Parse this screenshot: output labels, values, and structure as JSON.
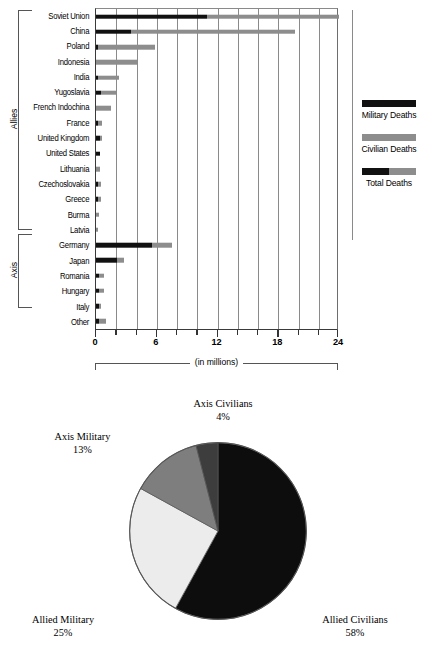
{
  "chart_data": [
    {
      "type": "bar",
      "orientation": "horizontal",
      "stacked": true,
      "title": "",
      "xlabel": "(in millions)",
      "ylabel": "",
      "xlim": [
        0,
        24
      ],
      "xticks": [
        0,
        6,
        12,
        18,
        24
      ],
      "xtick_labels": [
        "0",
        "6",
        "12",
        "18",
        "24"
      ],
      "minor_tick_step": 2,
      "grid": true,
      "legend_position": "right",
      "series": [
        {
          "name": "Military Deaths",
          "color": "#111111"
        },
        {
          "name": "Civilian Deaths",
          "color": "#8d8d8d"
        },
        {
          "name": "Total Deaths",
          "color": "#111111/#8d8d8d"
        }
      ],
      "groups": [
        {
          "name": "Allies",
          "categories": [
            "Soviet Union",
            "China",
            "Poland",
            "Indonesia",
            "India",
            "Yugoslavia",
            "French Indochina",
            "France",
            "United Kingdom",
            "United States",
            "Lithuania",
            "Czechoslovakia",
            "Greece",
            "Burma",
            "Latvia"
          ]
        },
        {
          "name": "Axis",
          "categories": [
            "Germany",
            "Japan",
            "Romania",
            "Hungary",
            "Italy"
          ]
        }
      ],
      "categories": [
        "Soviet Union",
        "China",
        "Poland",
        "Indonesia",
        "India",
        "Yugoslavia",
        "French Indochina",
        "France",
        "United Kingdom",
        "United States",
        "Lithuania",
        "Czechoslovakia",
        "Greece",
        "Burma",
        "Latvia",
        "Germany",
        "Japan",
        "Romania",
        "Hungary",
        "Italy",
        "Other"
      ],
      "bars": [
        {
          "category": "Soviet Union",
          "military": 11.0,
          "civilian": 13.0,
          "total": 24.0
        },
        {
          "category": "China",
          "military": 3.5,
          "civilian": 16.2,
          "total": 19.7
        },
        {
          "category": "Poland",
          "military": 0.24,
          "civilian": 5.6,
          "total": 5.8
        },
        {
          "category": "Indonesia",
          "military": 0.0,
          "civilian": 4.0,
          "total": 4.0
        },
        {
          "category": "India",
          "military": 0.09,
          "civilian": 2.1,
          "total": 2.2
        },
        {
          "category": "Yugoslavia",
          "military": 0.45,
          "civilian": 1.55,
          "total": 2.0
        },
        {
          "category": "French Indochina",
          "military": 0.0,
          "civilian": 1.5,
          "total": 1.5
        },
        {
          "category": "France",
          "military": 0.21,
          "civilian": 0.39,
          "total": 0.6
        },
        {
          "category": "United Kingdom",
          "military": 0.38,
          "civilian": 0.07,
          "total": 0.45
        },
        {
          "category": "United States",
          "military": 0.42,
          "civilian": 0.0,
          "total": 0.42
        },
        {
          "category": "Lithuania",
          "military": 0.0,
          "civilian": 0.35,
          "total": 0.35
        },
        {
          "category": "Czechoslovakia",
          "military": 0.03,
          "civilian": 0.32,
          "total": 0.35
        },
        {
          "category": "Greece",
          "military": 0.03,
          "civilian": 0.32,
          "total": 0.35
        },
        {
          "category": "Burma",
          "military": 0.0,
          "civilian": 0.25,
          "total": 0.25
        },
        {
          "category": "Latvia",
          "military": 0.0,
          "civilian": 0.22,
          "total": 0.22
        },
        {
          "category": "Germany",
          "military": 5.5,
          "civilian": 2.0,
          "total": 7.5
        },
        {
          "category": "Japan",
          "military": 2.1,
          "civilian": 0.7,
          "total": 2.8
        },
        {
          "category": "Romania",
          "military": 0.3,
          "civilian": 0.5,
          "total": 0.8
        },
        {
          "category": "Hungary",
          "military": 0.3,
          "civilian": 0.5,
          "total": 0.8
        },
        {
          "category": "Italy",
          "military": 0.3,
          "civilian": 0.15,
          "total": 0.45
        },
        {
          "category": "Other",
          "military": 0.25,
          "civilian": 0.75,
          "total": 1.0
        }
      ]
    },
    {
      "type": "pie",
      "title": "",
      "start_angle_deg": 0,
      "direction": "clockwise",
      "slices": [
        {
          "label": "Allied Civilians",
          "percent": 58,
          "percent_text": "58%",
          "color": "#0d0d0d"
        },
        {
          "label": "Allied Military",
          "percent": 25,
          "percent_text": "25%",
          "color": "#ececec"
        },
        {
          "label": "Axis Military",
          "percent": 13,
          "percent_text": "13%",
          "color": "#7e7e7e"
        },
        {
          "label": "Axis Civilians",
          "percent": 4,
          "percent_text": "4%",
          "color": "#3d3d3d"
        }
      ]
    }
  ],
  "bar_chart": {
    "xlabel": "(in millions)",
    "xtick_labels": [
      "0",
      "6",
      "12",
      "18",
      "24"
    ],
    "groups": {
      "allies": "Allies",
      "axis": "Axis"
    },
    "categories": [
      "Soviet Union",
      "China",
      "Poland",
      "Indonesia",
      "India",
      "Yugoslavia",
      "French Indochina",
      "France",
      "United Kingdom",
      "United States",
      "Lithuania",
      "Czechoslovakia",
      "Greece",
      "Burma",
      "Latvia",
      "Germany",
      "Japan",
      "Romania",
      "Hungary",
      "Italy",
      "Other"
    ],
    "legend": [
      {
        "label": "Military Deaths"
      },
      {
        "label": "Civilian Deaths"
      },
      {
        "label": "Total Deaths"
      }
    ]
  },
  "pie_chart": {
    "labels": {
      "axis_civilians": {
        "name": "Axis Civilians",
        "pct": "4%"
      },
      "axis_military": {
        "name": "Axis Military",
        "pct": "13%"
      },
      "allied_military": {
        "name": "Allied Military",
        "pct": "25%"
      },
      "allied_civilians": {
        "name": "Allied Civilians",
        "pct": "58%"
      }
    }
  },
  "colors": {
    "military": "#111111",
    "civilian": "#8d8d8d",
    "pie_allied_civilians": "#0d0d0d",
    "pie_allied_military": "#ececec",
    "pie_axis_military": "#7e7e7e",
    "pie_axis_civilians": "#3d3d3d"
  }
}
